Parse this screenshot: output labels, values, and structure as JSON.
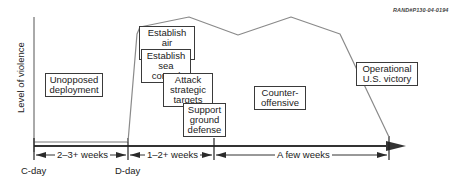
{
  "figure_ref": "RAND#P130-04-0194",
  "y_axis_label": "Level of violence",
  "phase_boxes": [
    {
      "id": "unopposed-deployment",
      "line1": "Unopposed",
      "line2": "deployment"
    },
    {
      "id": "establish-air-superiority",
      "line1": "Establish air",
      "line2": "superiority"
    },
    {
      "id": "establish-sea-control",
      "line1": "Establish",
      "line2": "sea control"
    },
    {
      "id": "attack-strategic-targets",
      "line1": "Attack",
      "line2": "strategic",
      "line3": "targets"
    },
    {
      "id": "support-ground-defense",
      "line1": "Support",
      "line2": "ground",
      "line3": "defense"
    },
    {
      "id": "counter-offensive",
      "line1": "Counter-",
      "line2": "offensive"
    },
    {
      "id": "operational-us-victory",
      "line1": "Operational",
      "line2": "U.S. victory"
    }
  ],
  "timeline": {
    "markers": [
      {
        "label": "C-day"
      },
      {
        "label": "D-day"
      }
    ],
    "durations": [
      {
        "label": "2–3+ weeks"
      },
      {
        "label": "1–2+ weeks"
      },
      {
        "label": "A few weeks"
      }
    ]
  },
  "colors": {
    "axis": "#333333",
    "violence_line": "#8a8a8a",
    "box_border": "#3a3a3a"
  }
}
